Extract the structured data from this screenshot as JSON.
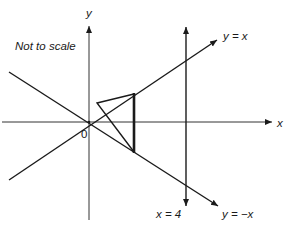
{
  "diagram": {
    "note": "Not to scale",
    "axes": {
      "x_label": "x",
      "y_label": "y",
      "origin_label": "0"
    },
    "lines": {
      "y_eq_x": "y = x",
      "y_eq_neg_x": "y = −x",
      "x_eq_4": "x = 4"
    },
    "colors": {
      "stroke": "#1a1a1a",
      "background": "#ffffff"
    }
  }
}
